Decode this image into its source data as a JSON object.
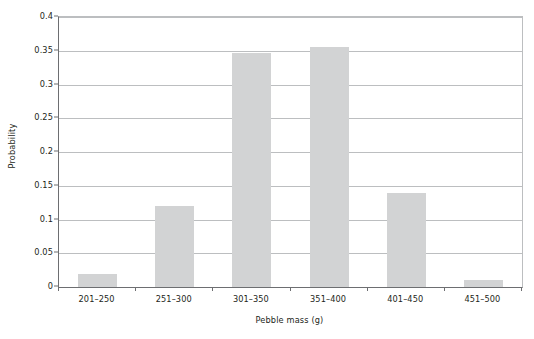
{
  "chart_data": {
    "type": "bar",
    "title": "",
    "subtitle": "",
    "xlabel": "Pebble mass (g)",
    "ylabel": "Probability",
    "categories": [
      "201–250",
      "251–300",
      "301–350",
      "351–400",
      "401–450",
      "451–500"
    ],
    "values": [
      0.02,
      0.12,
      0.347,
      0.356,
      0.14,
      0.01
    ],
    "series": [
      {
        "name": "Probability",
        "values": [
          0.02,
          0.12,
          0.347,
          0.356,
          0.14,
          0.01
        ]
      }
    ],
    "ylim": [
      0,
      0.4
    ],
    "ytick_values": [
      0,
      0.05,
      0.1,
      0.15,
      0.2,
      0.25,
      0.3,
      0.35,
      0.4
    ],
    "ytick_labels": [
      "0",
      "0.05",
      "0.1",
      "0.15",
      "0.2",
      "0.25",
      "0.3",
      "0.35",
      "0.4"
    ],
    "grid": "horizontal",
    "legend": "none",
    "bar_color": "#d2d3d4",
    "axis_color": "#6d6e71",
    "grid_color": "#bcbec0",
    "text_color": "#231f20",
    "annotations": []
  },
  "axes": {
    "y_title": "Probability",
    "x_title": "Pebble mass (g)"
  }
}
